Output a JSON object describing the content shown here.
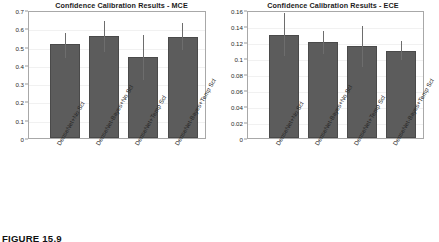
{
  "figure": {
    "caption": "FIGURE 15.9",
    "background_color": "#ffffff",
    "bar_color": "#5c5c5c",
    "error_bar_color": "#6d6d6d",
    "axis_color": "#a8a8a8"
  },
  "charts": [
    {
      "id": "mce-chart",
      "title": "Confidence Calibration Results - MCE",
      "metric": "MCE"
    },
    {
      "id": "ece-chart",
      "title": "Confidence Calibration Results - ECE",
      "metric": "ECE"
    }
  ],
  "chart_data": [
    {
      "type": "bar",
      "title": "Confidence Calibration Results - MCE",
      "xlabel": "",
      "ylabel": "",
      "ylim": [
        0,
        0.7
      ],
      "grid": false,
      "legend": "none",
      "categories": [
        "DenseNet+No Scl",
        "DenseNet-Bayes+No Scl",
        "DenseNet+Temp Scl",
        "DenseNet-Bayes+Temp Scl"
      ],
      "values": [
        0.512,
        0.558,
        0.441,
        0.554
      ],
      "error_low": [
        0.435,
        0.47,
        0.315,
        0.483
      ],
      "error_high": [
        0.572,
        0.638,
        0.565,
        0.628
      ],
      "ytick_labels": [
        "0.7",
        "0.6",
        "0.5",
        "0.4",
        "0.3",
        "0.2",
        "0.1",
        "0"
      ],
      "ytick_values": [
        0.7,
        0.6,
        0.5,
        0.4,
        0.3,
        0.2,
        0.1,
        0
      ]
    },
    {
      "type": "bar",
      "title": "Confidence Calibration Results - ECE",
      "xlabel": "",
      "ylabel": "",
      "ylim": [
        0,
        0.16
      ],
      "grid": false,
      "legend": "none",
      "categories": [
        "DenseNet+No Scl",
        "DenseNet-Bayes+No Scl",
        "DenseNet+Temp Scl",
        "DenseNet-Bayes+Temp Scl"
      ],
      "values": [
        0.129,
        0.12,
        0.1155,
        0.1085
      ],
      "error_low": [
        0.102,
        0.1055,
        0.0885,
        0.0975
      ],
      "error_high": [
        0.1565,
        0.1335,
        0.1405,
        0.1215
      ],
      "ytick_labels": [
        "0.16",
        "0.14",
        "0.12",
        "0.1",
        "0.08",
        "0.06",
        "0.04",
        "0.02",
        "0"
      ],
      "ytick_values": [
        0.16,
        0.14,
        0.12,
        0.1,
        0.08,
        0.06,
        0.04,
        0.02,
        0
      ]
    }
  ]
}
